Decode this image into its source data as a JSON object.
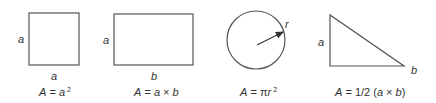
{
  "shapes": [
    {
      "name": "square",
      "side_labels": {
        "left": "a",
        "bottom": "a"
      },
      "formula": {
        "lhs": "A",
        "eq": " = ",
        "var": "a",
        "sup": "2"
      }
    },
    {
      "name": "rectangle",
      "side_labels": {
        "left": "a",
        "bottom": "b"
      },
      "formula": {
        "lhs": "A",
        "eq": " = ",
        "a": "a",
        "op": " × ",
        "b": "b"
      }
    },
    {
      "name": "circle",
      "side_labels": {
        "radius": "r"
      },
      "formula": {
        "lhs": "A",
        "eq": " = ",
        "pi": "π",
        "var": "r",
        "sup": "2"
      }
    },
    {
      "name": "right-triangle",
      "side_labels": {
        "left": "a",
        "bottom": "b"
      },
      "formula": {
        "lhs": "A",
        "eq": " = 1/2 (",
        "a": "a",
        "op": " × ",
        "b": "b",
        "close": ")"
      }
    }
  ]
}
